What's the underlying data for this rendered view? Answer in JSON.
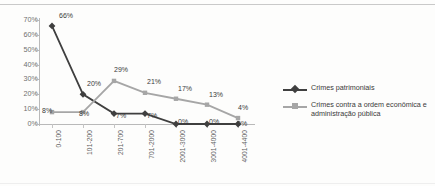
{
  "chart_data": {
    "type": "line",
    "title": "",
    "xlabel": "",
    "ylabel": "",
    "ylim": [
      0,
      70
    ],
    "ytick_labels": [
      "0%",
      "10%",
      "20%",
      "30%",
      "40%",
      "50%",
      "60%",
      "70%"
    ],
    "ytick_values": [
      0,
      10,
      20,
      30,
      40,
      50,
      60,
      70
    ],
    "grid": false,
    "legend_position": "right",
    "categories": [
      "0-100",
      "101-200",
      "201-700",
      "701-2000",
      "2001-3000",
      "3001-4000",
      "4001-4400"
    ],
    "series": [
      {
        "name": "Crimes patrimoniais",
        "color": "#3f3f3f",
        "marker": "diamond",
        "values": [
          66,
          20,
          7,
          7,
          0,
          0,
          0
        ],
        "labels": [
          "66%",
          "20%",
          "7%",
          "7%",
          "0%",
          "0%",
          "0%"
        ]
      },
      {
        "name": "Crimes contra a ordem econômica e administração pública",
        "color": "#a6a6a6",
        "marker": "square",
        "values": [
          8,
          8,
          29,
          21,
          17,
          13,
          4
        ],
        "labels": [
          "8%",
          "8%",
          "29%",
          "21%",
          "17%",
          "13%",
          "4%"
        ]
      }
    ]
  },
  "legend": {
    "items": [
      {
        "label": "Crimes patrimoniais"
      },
      {
        "label": "Crimes contra a ordem econômica e administração pública"
      }
    ]
  },
  "colors": {
    "series_dark": "#3f3f3f",
    "series_gray": "#a6a6a6",
    "axis": "#b9b9b9",
    "background": "#fdfdfc",
    "rule": "#c9c9c9"
  }
}
